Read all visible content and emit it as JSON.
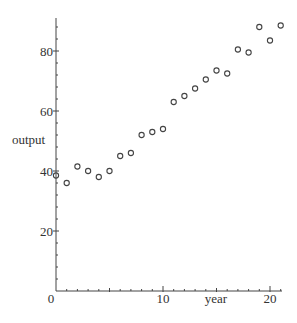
{
  "chart_data": {
    "type": "scatter",
    "title": "",
    "xlabel": "year",
    "ylabel": "output",
    "xlim": [
      0,
      21
    ],
    "ylim": [
      0,
      91
    ],
    "x_ticks": [
      0,
      10,
      20
    ],
    "y_ticks": [
      0,
      20,
      40,
      60,
      80
    ],
    "x_tick_labels": [
      "0",
      "10",
      "20"
    ],
    "y_tick_labels": [
      "20",
      "40",
      "60",
      "80"
    ],
    "origin_label": "0",
    "grid": false,
    "legend": null,
    "marker": "open-circle",
    "series": [
      {
        "name": "output",
        "x": [
          0,
          1,
          2,
          3,
          4,
          5,
          6,
          7,
          8,
          9,
          10,
          11,
          12,
          13,
          14,
          15,
          16,
          17,
          18,
          19,
          20,
          21
        ],
        "y": [
          38.5,
          36,
          41.5,
          40,
          38,
          40,
          45,
          46,
          52,
          53,
          54,
          63,
          65,
          67.5,
          70.5,
          73.5,
          72.5,
          80.5,
          79.5,
          88,
          83.5,
          88.5
        ]
      }
    ]
  }
}
